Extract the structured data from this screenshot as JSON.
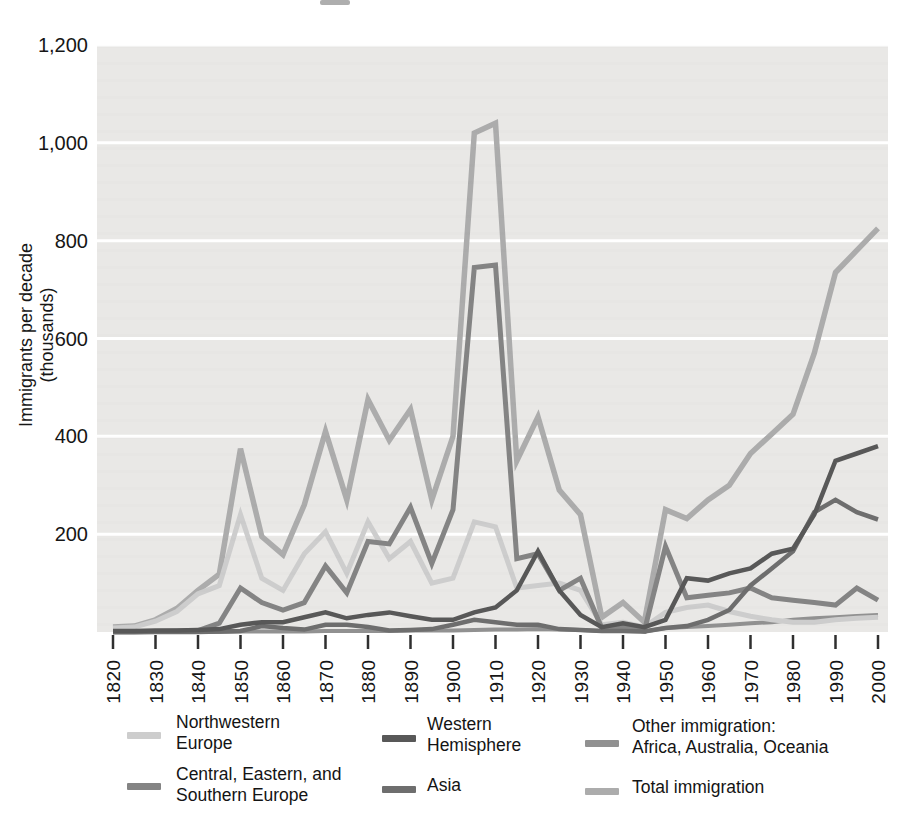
{
  "figure": {
    "type_note": "printed textbook line chart, grayscale",
    "background_color": "#ffffff"
  },
  "axis": {
    "ylabel_line1": "Immigrants per decade",
    "ylabel_line2": "(thousands)"
  },
  "legend": {
    "items": [
      {
        "key": "nw",
        "label": "Northwestern\nEurope"
      },
      {
        "key": "ces",
        "label": "Central, Eastern, and\nSouthern Europe"
      },
      {
        "key": "whem",
        "label": "Western\nHemisphere"
      },
      {
        "key": "asia",
        "label": "Asia"
      },
      {
        "key": "other",
        "label": "Other immigration:\nAfrica, Australia, Oceania"
      },
      {
        "key": "total",
        "label": "Total immigration"
      }
    ]
  },
  "chart_data": {
    "type": "line",
    "title": "",
    "xlabel": "",
    "ylabel": "Immigrants per decade (thousands)",
    "ylim": [
      0,
      1200
    ],
    "grid": "horizontal-white-on-gray",
    "plot_bg": "#e9e8e6",
    "grid_color": "#ffffff",
    "tick_color": "#2f2f2f",
    "legend_position": "below",
    "x": [
      1820,
      1825,
      1830,
      1835,
      1840,
      1845,
      1850,
      1855,
      1860,
      1865,
      1870,
      1875,
      1880,
      1885,
      1890,
      1895,
      1900,
      1905,
      1910,
      1915,
      1920,
      1925,
      1930,
      1935,
      1940,
      1945,
      1950,
      1955,
      1960,
      1965,
      1970,
      1975,
      1980,
      1985,
      1990,
      1995,
      2000
    ],
    "xticks": [
      1820,
      1830,
      1840,
      1850,
      1860,
      1870,
      1880,
      1890,
      1900,
      1910,
      1920,
      1930,
      1940,
      1950,
      1960,
      1970,
      1980,
      1990,
      2000
    ],
    "yticks": {
      "values": [
        200,
        400,
        600,
        800,
        1000,
        1200
      ],
      "labels": [
        "200",
        "400",
        "600",
        "800",
        "1,000",
        "1,200"
      ]
    },
    "draw_order": [
      "total",
      "other",
      "nw",
      "ces",
      "asia",
      "whem"
    ],
    "series": [
      {
        "key": "nw",
        "name": "Northwestern Europe",
        "color": "#cdcdcd",
        "width": 5,
        "values": [
          8,
          10,
          22,
          42,
          78,
          95,
          240,
          110,
          85,
          160,
          205,
          120,
          225,
          150,
          185,
          100,
          110,
          225,
          215,
          90,
          95,
          100,
          85,
          15,
          20,
          10,
          40,
          50,
          55,
          42,
          32,
          25,
          20,
          20,
          25,
          28,
          30
        ]
      },
      {
        "key": "ces",
        "name": "Central, Eastern, and Southern Europe",
        "color": "#848484",
        "width": 5,
        "values": [
          0,
          0,
          1,
          2,
          3,
          18,
          90,
          60,
          45,
          60,
          135,
          80,
          185,
          180,
          255,
          140,
          250,
          745,
          750,
          150,
          160,
          85,
          110,
          8,
          10,
          2,
          175,
          70,
          75,
          80,
          90,
          70,
          65,
          60,
          55,
          90,
          65
        ]
      },
      {
        "key": "whem",
        "name": "Western Hemisphere",
        "color": "#585858",
        "width": 4.5,
        "values": [
          2,
          2,
          3,
          3,
          4,
          6,
          15,
          20,
          20,
          30,
          40,
          28,
          35,
          40,
          32,
          25,
          25,
          40,
          50,
          85,
          165,
          85,
          35,
          10,
          18,
          10,
          25,
          110,
          105,
          120,
          130,
          160,
          170,
          240,
          350,
          365,
          380
        ]
      },
      {
        "key": "asia",
        "name": "Asia",
        "color": "#6e6e6e",
        "width": 4.5,
        "values": [
          0,
          0,
          0,
          0,
          0,
          1,
          2,
          12,
          8,
          5,
          15,
          15,
          10,
          3,
          4,
          6,
          15,
          25,
          20,
          15,
          15,
          6,
          4,
          2,
          2,
          1,
          8,
          12,
          25,
          45,
          95,
          130,
          165,
          245,
          270,
          245,
          230
        ]
      },
      {
        "key": "other",
        "name": "Other immigration: Africa, Australia, Oceania",
        "color": "#919191",
        "width": 4,
        "values": [
          0,
          0,
          0,
          0,
          0,
          0,
          1,
          1,
          1,
          1,
          2,
          2,
          2,
          2,
          3,
          3,
          3,
          4,
          5,
          5,
          6,
          5,
          4,
          2,
          2,
          1,
          8,
          10,
          12,
          15,
          18,
          20,
          25,
          28,
          30,
          33,
          35
        ]
      },
      {
        "key": "total",
        "name": "Total immigration",
        "color": "#acacac",
        "width": 5.5,
        "values": [
          10,
          12,
          25,
          48,
          85,
          118,
          375,
          195,
          158,
          260,
          410,
          270,
          475,
          392,
          455,
          270,
          400,
          1020,
          1040,
          350,
          440,
          290,
          240,
          30,
          60,
          20,
          250,
          232,
          270,
          300,
          365,
          405,
          445,
          570,
          735,
          780,
          825
        ]
      }
    ]
  }
}
